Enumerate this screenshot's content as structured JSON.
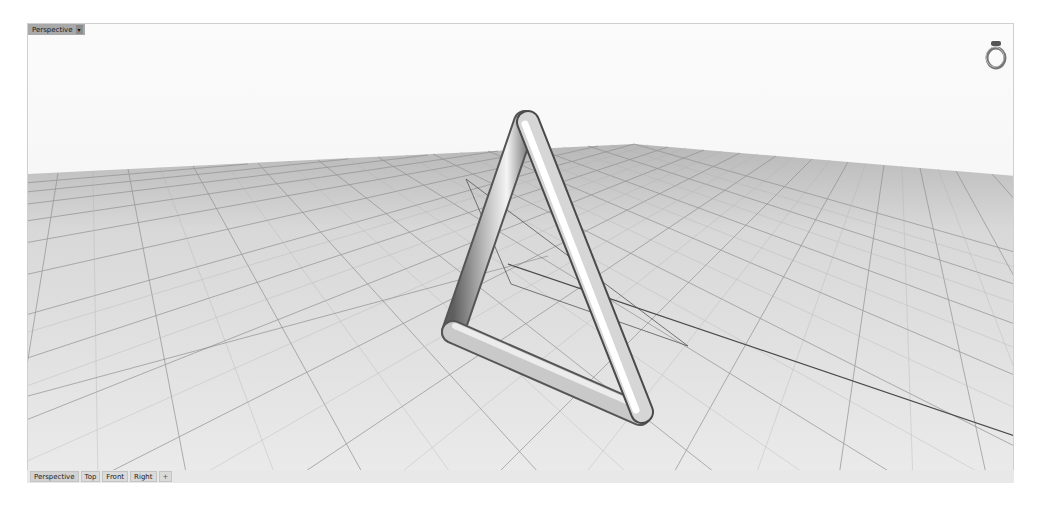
{
  "viewport": {
    "title": "Perspective",
    "menu_arrow": "▾",
    "object": "triangular tube (pipe) model",
    "grid": "construction plane grid"
  },
  "navigation": {
    "widget_icon": "ring-icon"
  },
  "tabs": [
    {
      "label": "Perspective",
      "active": true
    },
    {
      "label": "Top",
      "active": false
    },
    {
      "label": "Front",
      "active": false
    },
    {
      "label": "Right",
      "active": false
    },
    {
      "label": "+",
      "active": false,
      "icon": "add-viewport-icon"
    }
  ],
  "colors": {
    "background": "#f6f6f6",
    "grid_line": "#9a9a9a",
    "grid_major": "#5a5a5a",
    "tube_light": "#f2f2f2",
    "tube_dark": "#6e6e6e",
    "label_bg": "#a9a9a9"
  }
}
